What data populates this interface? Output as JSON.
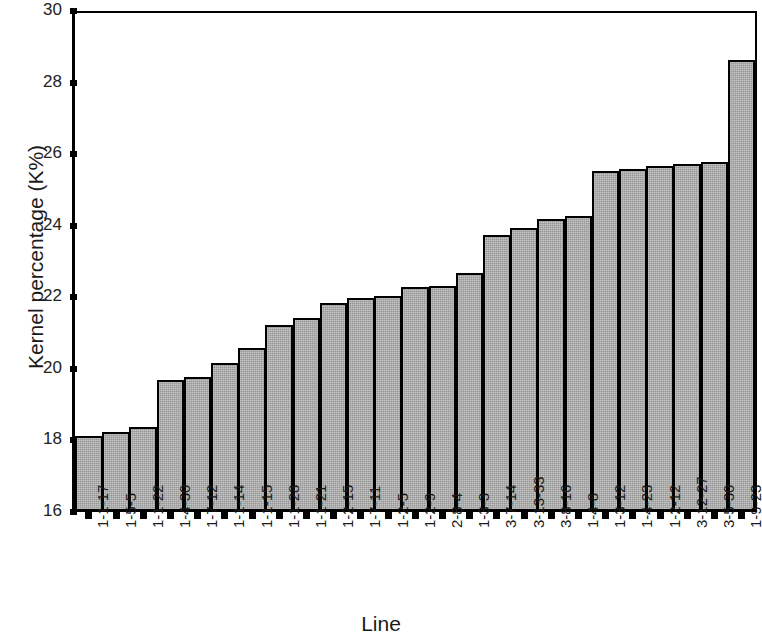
{
  "chart_data": {
    "type": "bar",
    "title": "",
    "xlabel": "Line",
    "ylabel": "Kernel percentage (K%)",
    "ylim": [
      16,
      30
    ],
    "ytick_step": 2,
    "yticks": [
      16,
      18,
      20,
      22,
      24,
      26,
      28,
      30
    ],
    "grid": false,
    "legend": null,
    "bar_color": "#a9a9a9",
    "bar_edge_color": "#000000",
    "categories": [
      "1-1-17",
      "1-5-5",
      "1-1-22",
      "1-4-30",
      "1-7-12",
      "1-1-14",
      "1-1-15",
      "1-1-28",
      "1-1-21",
      "1-2-15",
      "1-7-11",
      "1-2-5",
      "1-2-9",
      "2-8-4",
      "1-3-3",
      "3-7-14",
      "3-13-33",
      "3-8-16",
      "1-4-8",
      "1-3-12",
      "1-4-23",
      "1-2-12",
      "3-12-27",
      "3-5-30",
      "1-9-23"
    ],
    "values": [
      18.1,
      18.2,
      18.35,
      19.65,
      19.75,
      20.15,
      20.55,
      21.2,
      21.4,
      21.8,
      21.95,
      22.0,
      22.25,
      22.3,
      22.65,
      23.7,
      23.9,
      24.15,
      24.25,
      25.5,
      25.55,
      25.65,
      25.7,
      25.75,
      28.6
    ]
  }
}
